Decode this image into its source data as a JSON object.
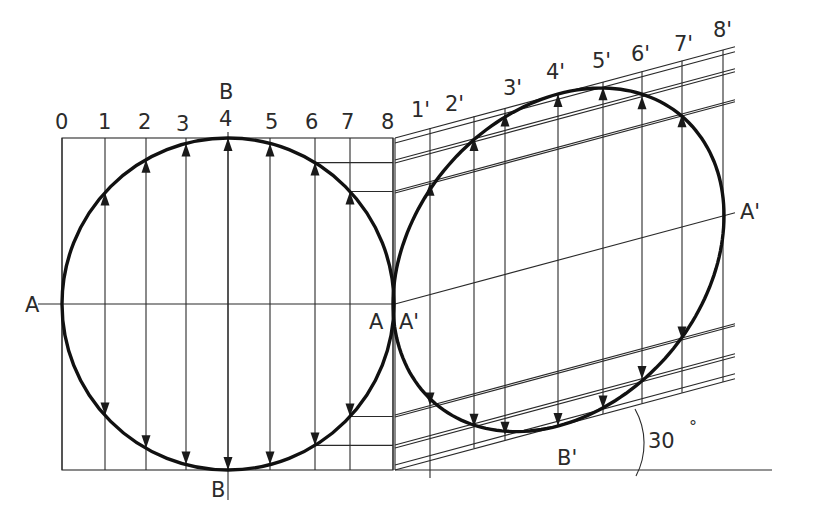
{
  "diagram": {
    "type": "oblique-projection-of-circle",
    "colors": {
      "line": "#2a2a2a",
      "curve": "#111111",
      "text": "#2b2b2b",
      "background": "#ffffff"
    },
    "angle_label": "30°",
    "angle_value": "30",
    "angle_degree_symbol": "°",
    "left_view": {
      "division_labels": [
        "0",
        "1",
        "2",
        "3",
        "4",
        "5",
        "6",
        "7",
        "8"
      ],
      "division_x": [
        62,
        105,
        146,
        186,
        228,
        270,
        315,
        350,
        393
      ],
      "axis_labels": {
        "left_A": "A",
        "right_A": "A",
        "top_B": "B",
        "bottom_B": "B"
      },
      "center": [
        228,
        304
      ],
      "radius": 166
    },
    "right_view": {
      "division_labels": [
        "1'",
        "2'",
        "3'",
        "4'",
        "5'",
        "6'",
        "7'",
        "8'"
      ],
      "division_x": [
        430,
        474,
        505,
        558,
        603,
        642,
        682,
        723
      ],
      "axis_labels": {
        "left_A": "A'",
        "right_A": "A'",
        "bottom_B": "B'"
      },
      "slope": -0.267,
      "origin_x": 393
    }
  }
}
